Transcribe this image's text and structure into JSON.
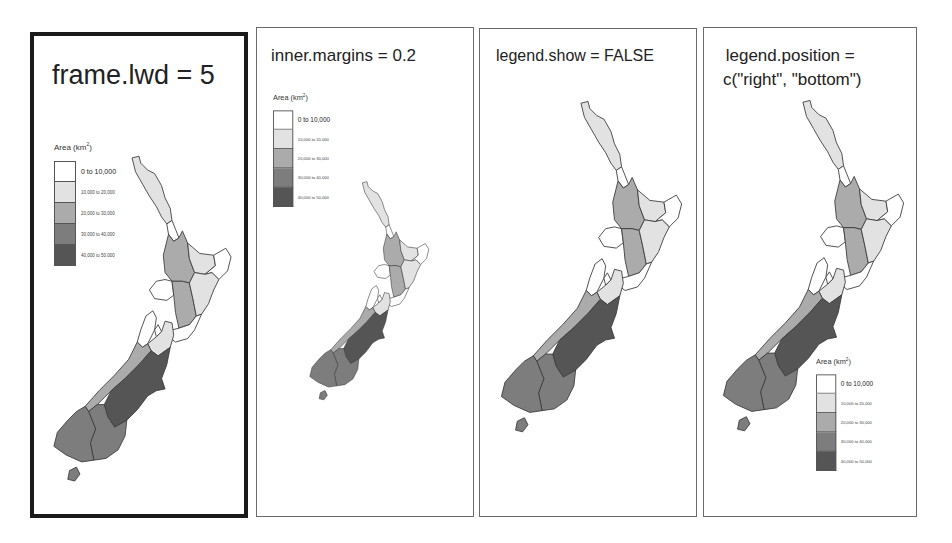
{
  "panels": [
    {
      "id": "frame-lwd",
      "title": "frame.lwd = 5",
      "legend_visible": true,
      "legend_position": "left-top"
    },
    {
      "id": "inner-margins",
      "title": "inner.margins = 0.2",
      "legend_visible": true,
      "legend_position": "left-top"
    },
    {
      "id": "legend-show",
      "title": "legend.show = FALSE",
      "legend_visible": false
    },
    {
      "id": "legend-position",
      "title_line1": "legend.position =",
      "title_line2": "c(\"right\", \"bottom\")",
      "legend_visible": true,
      "legend_position": "right-bottom"
    }
  ],
  "legend": {
    "title": "Area (km",
    "title_sup": "2",
    "title_close": ")",
    "classes": [
      {
        "label": "0 to 10,000",
        "color": "#ffffff"
      },
      {
        "label": "10,000 to 20,000",
        "color": "#e2e2e2"
      },
      {
        "label": "20,000 to 30,000",
        "color": "#ababab"
      },
      {
        "label": "30,000 to 40,000",
        "color": "#7d7d7d"
      },
      {
        "label": "40,000 to 50,000",
        "color": "#555555"
      }
    ]
  },
  "map": {
    "subject": "New Zealand regions",
    "variable": "Area (km2)",
    "regions": [
      {
        "name": "Northland",
        "class": 1
      },
      {
        "name": "Auckland",
        "class": 0
      },
      {
        "name": "Waikato",
        "class": 2
      },
      {
        "name": "Bay of Plenty",
        "class": 1
      },
      {
        "name": "Gisborne",
        "class": 0
      },
      {
        "name": "Taranaki",
        "class": 0
      },
      {
        "name": "Manawatu-Wanganui",
        "class": 2
      },
      {
        "name": "Hawke's Bay",
        "class": 1
      },
      {
        "name": "Wellington",
        "class": 0
      },
      {
        "name": "Tasman",
        "class": 0
      },
      {
        "name": "Nelson",
        "class": 0
      },
      {
        "name": "Marlborough",
        "class": 1
      },
      {
        "name": "West Coast",
        "class": 2
      },
      {
        "name": "Canterbury",
        "class": 4
      },
      {
        "name": "Otago",
        "class": 3
      },
      {
        "name": "Southland",
        "class": 3
      },
      {
        "name": "Stewart Island",
        "class": 3
      }
    ]
  }
}
